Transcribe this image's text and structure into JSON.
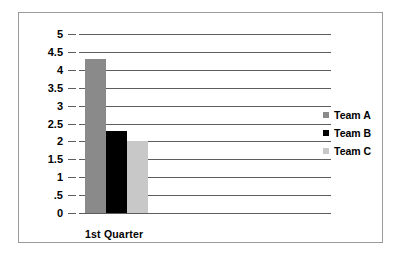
{
  "chart_data": {
    "type": "bar",
    "title": "",
    "subtitle": "",
    "xlabel": "",
    "ylabel": "",
    "categories": [
      "1st Quarter"
    ],
    "series": [
      {
        "name": "Team A",
        "values": [
          4.3
        ],
        "color": "#8a8a8a"
      },
      {
        "name": "Team B",
        "values": [
          2.3
        ],
        "color": "#000000"
      },
      {
        "name": "Team C",
        "values": [
          2.0
        ],
        "color": "#c8c8c8"
      }
    ],
    "ylim": [
      0,
      5
    ],
    "ytick_values": [
      5,
      4.5,
      4,
      3.5,
      3,
      2.5,
      2,
      1.5,
      1,
      0.5,
      0
    ],
    "ytick_labels": [
      "5",
      "4.5",
      "4",
      "3.5",
      "3",
      "2.5",
      "2",
      "1.5",
      "1",
      ".5",
      "0"
    ],
    "grid": "horizontal",
    "legend_position": "right",
    "annotations": []
  },
  "axis": {
    "y_labels": [
      "5",
      "4.5",
      "4",
      "3.5",
      "3",
      "2.5",
      "2",
      "1.5",
      "1",
      ".5",
      "0"
    ],
    "x_labels": [
      "1st Quarter"
    ]
  },
  "legend": {
    "items": [
      {
        "label": "Team A",
        "color": "#8a8a8a"
      },
      {
        "label": "Team B",
        "color": "#000000"
      },
      {
        "label": "Team C",
        "color": "#c8c8c8"
      }
    ]
  },
  "colors": {
    "team_a": "#8a8a8a",
    "team_b": "#000000",
    "team_c": "#c8c8c8",
    "gridline": "#5d5d5d",
    "border": "#9a9a9a",
    "background": "#ffffff",
    "text": "#000000"
  }
}
